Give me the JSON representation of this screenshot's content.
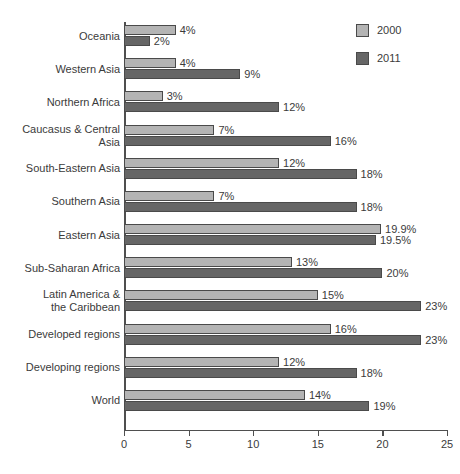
{
  "chart_data": {
    "type": "bar",
    "orientation": "horizontal",
    "title": "",
    "subtitle": "",
    "xlabel": "",
    "ylabel": "",
    "xlim": [
      0,
      25
    ],
    "xticks": [
      0,
      5,
      10,
      15,
      20,
      25
    ],
    "xtick_labels": [
      "0",
      "5",
      "10",
      "15",
      "20",
      "25"
    ],
    "grid": false,
    "legend_position": "top-right",
    "categories": [
      "Oceania",
      "Western Asia",
      "Northern Africa",
      "Caucasus & Central Asia",
      "South-Eastern Asia",
      "Southern Asia",
      "Eastern Asia",
      "Sub-Saharan Africa",
      "Latin America & the Caribbean",
      "Developed regions",
      "Developing regions",
      "World"
    ],
    "category_label_lines": [
      [
        "Oceania"
      ],
      [
        "Western Asia"
      ],
      [
        "Northern Africa"
      ],
      [
        "Caucasus & Central",
        "Asia"
      ],
      [
        "South-Eastern Asia"
      ],
      [
        "Southern Asia"
      ],
      [
        "Eastern Asia"
      ],
      [
        "Sub-Saharan Africa"
      ],
      [
        "Latin America &",
        "the Caribbean"
      ],
      [
        "Developed regions"
      ],
      [
        "Developing regions"
      ],
      [
        "World"
      ]
    ],
    "series": [
      {
        "name": "2000",
        "color": "#b4b4b4",
        "values": [
          4,
          4,
          3,
          7,
          12,
          7,
          19.9,
          13,
          15,
          16,
          12,
          14
        ],
        "labels": [
          "4%",
          "4%",
          "3%",
          "7%",
          "12%",
          "7%",
          "19.9%",
          "13%",
          "15%",
          "16%",
          "12%",
          "14%"
        ]
      },
      {
        "name": "2011",
        "color": "#666666",
        "values": [
          2,
          9,
          12,
          16,
          18,
          18,
          19.5,
          20,
          23,
          23,
          18,
          19
        ],
        "labels": [
          "2%",
          "9%",
          "12%",
          "16%",
          "18%",
          "18%",
          "19.5%",
          "20%",
          "23%",
          "23%",
          "18%",
          "19%"
        ]
      }
    ]
  },
  "legend": {
    "items": [
      {
        "label": "2000",
        "color": "#b4b4b4"
      },
      {
        "label": "2011",
        "color": "#666666"
      }
    ]
  }
}
